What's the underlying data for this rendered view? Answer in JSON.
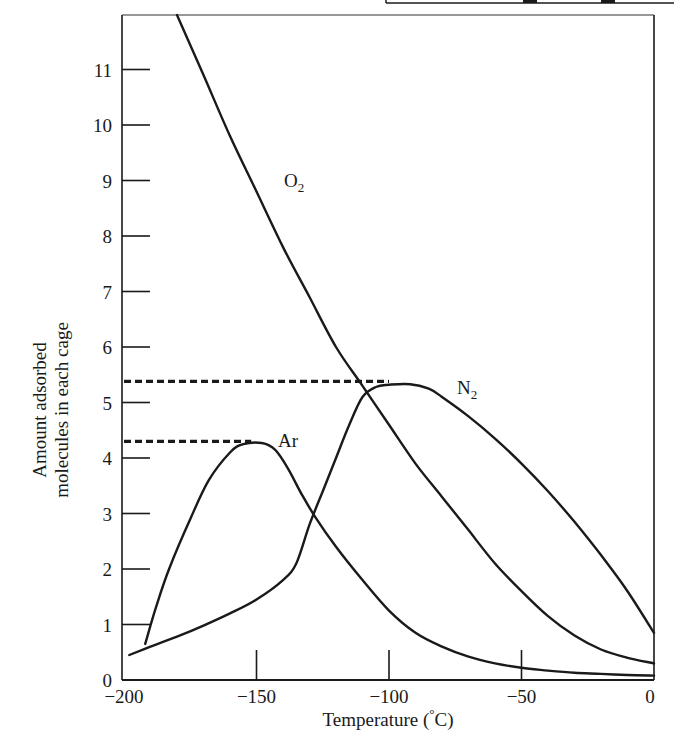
{
  "chart_data": {
    "type": "line",
    "title": "",
    "xlabel": "Temperature (°C)",
    "ylabel": [
      "Amount adsorbed",
      "molecules in each cage"
    ],
    "xlim": [
      -200,
      0
    ],
    "ylim": [
      0,
      12
    ],
    "grid": false,
    "legend": "inline labels",
    "x_ticks": [
      -200,
      -150,
      -100,
      -50,
      0
    ],
    "x_tick_labels": [
      "−200",
      "−150",
      "−100",
      "−50",
      "0"
    ],
    "y_ticks": [
      0,
      1,
      2,
      3,
      4,
      5,
      6,
      7,
      8,
      9,
      10,
      11
    ],
    "y_tick_labels": [
      "0",
      "1",
      "2",
      "3",
      "4",
      "5",
      "6",
      "7",
      "8",
      "9",
      "10",
      "11"
    ],
    "series": [
      {
        "name": "O2",
        "label_main": "O",
        "label_sub": "2",
        "points": [
          [
            -180,
            12.0
          ],
          [
            -170,
            10.9
          ],
          [
            -160,
            9.8
          ],
          [
            -150,
            8.8
          ],
          [
            -140,
            7.8
          ],
          [
            -130,
            6.9
          ],
          [
            -120,
            6.0
          ],
          [
            -110,
            5.3
          ],
          [
            -100,
            4.6
          ],
          [
            -90,
            3.9
          ],
          [
            -80,
            3.3
          ],
          [
            -70,
            2.7
          ],
          [
            -60,
            2.1
          ],
          [
            -50,
            1.6
          ],
          [
            -40,
            1.15
          ],
          [
            -30,
            0.8
          ],
          [
            -20,
            0.55
          ],
          [
            -10,
            0.4
          ],
          [
            0,
            0.3
          ]
        ]
      },
      {
        "name": "N2",
        "label_main": "N",
        "label_sub": "2",
        "points": [
          [
            -198,
            0.45
          ],
          [
            -190,
            0.6
          ],
          [
            -180,
            0.78
          ],
          [
            -170,
            0.98
          ],
          [
            -160,
            1.2
          ],
          [
            -150,
            1.45
          ],
          [
            -140,
            1.8
          ],
          [
            -135,
            2.1
          ],
          [
            -130,
            2.8
          ],
          [
            -125,
            3.4
          ],
          [
            -120,
            4.0
          ],
          [
            -115,
            4.6
          ],
          [
            -110,
            5.1
          ],
          [
            -105,
            5.28
          ],
          [
            -100,
            5.32
          ],
          [
            -92,
            5.33
          ],
          [
            -85,
            5.25
          ],
          [
            -80,
            5.1
          ],
          [
            -70,
            4.75
          ],
          [
            -60,
            4.35
          ],
          [
            -50,
            3.9
          ],
          [
            -40,
            3.4
          ],
          [
            -30,
            2.85
          ],
          [
            -20,
            2.25
          ],
          [
            -10,
            1.6
          ],
          [
            0,
            0.85
          ]
        ]
      },
      {
        "name": "Ar",
        "label_main": "Ar",
        "label_sub": "",
        "points": [
          [
            -192,
            0.65
          ],
          [
            -188,
            1.3
          ],
          [
            -183,
            2.0
          ],
          [
            -175,
            2.9
          ],
          [
            -168,
            3.6
          ],
          [
            -160,
            4.1
          ],
          [
            -155,
            4.25
          ],
          [
            -148,
            4.27
          ],
          [
            -143,
            4.15
          ],
          [
            -138,
            3.8
          ],
          [
            -133,
            3.35
          ],
          [
            -128,
            2.95
          ],
          [
            -120,
            2.4
          ],
          [
            -110,
            1.8
          ],
          [
            -100,
            1.25
          ],
          [
            -90,
            0.85
          ],
          [
            -80,
            0.6
          ],
          [
            -70,
            0.42
          ],
          [
            -60,
            0.3
          ],
          [
            -50,
            0.22
          ],
          [
            -40,
            0.17
          ],
          [
            -30,
            0.13
          ],
          [
            -20,
            0.11
          ],
          [
            -10,
            0.09
          ],
          [
            0,
            0.08
          ]
        ]
      }
    ],
    "annotations": [
      {
        "type": "dashed-hline",
        "y": 5.38,
        "x_from": -200,
        "x_to": -100,
        "note": "N2 maximum"
      },
      {
        "type": "dashed-hline",
        "y": 4.3,
        "x_from": -200,
        "x_to": -152,
        "note": "Ar maximum"
      }
    ]
  },
  "labels": {
    "xlabel": "Temperature (°C)",
    "xlabel_prefix": "Temperature (",
    "xlabel_degree": "°",
    "xlabel_suffix": "C)",
    "ylabel_line1": "Amount adsorbed",
    "ylabel_line2": "molecules in each cage",
    "o2_main": "O",
    "o2_sub": "2",
    "n2_main": "N",
    "n2_sub": "2",
    "ar": "Ar"
  },
  "colors": {
    "ink": "#1a1a1a",
    "background": "#ffffff"
  }
}
